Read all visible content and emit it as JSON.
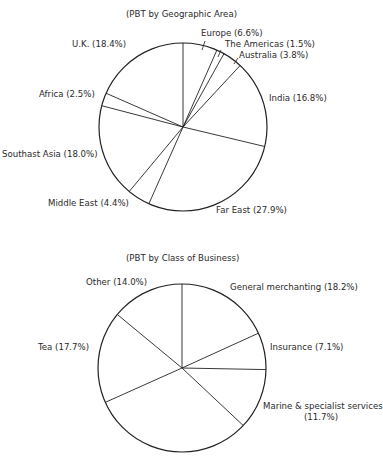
{
  "chart_data": [
    {
      "type": "pie",
      "title": "(PBT by Geographic Area)",
      "start": "top",
      "direction": "clockwise",
      "categories": [
        "Europe",
        "The Americas",
        "Australia",
        "India",
        "Far East",
        "Middle East",
        "Southast Asia",
        "Africa",
        "U.K."
      ],
      "values": [
        6.6,
        1.5,
        3.8,
        16.8,
        27.9,
        4.4,
        18.0,
        2.5,
        18.4
      ],
      "labels": [
        "Europe (6.6%)",
        "The Americas (1.5%)",
        "Australia (3.8%)",
        "India (16.8%)",
        "Far East (27.9%)",
        "Middle East (4.4%)",
        "Southast Asia (18.0%)",
        "Africa (2.5%)",
        "U.K. (18.4%)"
      ]
    },
    {
      "type": "pie",
      "title": "(PBT by Class of Business)",
      "start": "top",
      "direction": "clockwise",
      "categories": [
        "General merchanting",
        "Insurance",
        "Marine & specialist services",
        "(unlabeled)",
        "Tea",
        "Other"
      ],
      "values": [
        18.2,
        7.1,
        11.7,
        31.3,
        17.7,
        14.0
      ],
      "labels": [
        "General merchanting (18.2%)",
        "Insurance (7.1%)",
        "Marine & specialist services (11.7%)",
        "",
        "Tea (17.7%)",
        "Other (14.0%)"
      ]
    }
  ],
  "chart1": {
    "title": "(PBT by Geographic Area)",
    "labels": {
      "europe": "Europe (6.6%)",
      "americas": "The Americas (1.5%)",
      "australia": "Australia (3.8%)",
      "india": "India (16.8%)",
      "far_east": "Far East (27.9%)",
      "middle_east": "Middle East (4.4%)",
      "southeast_asia": "Southast Asia (18.0%)",
      "africa": "Africa (2.5%)",
      "uk": "U.K. (18.4%)"
    }
  },
  "chart2": {
    "title": "(PBT by Class of Business)",
    "labels": {
      "general": "General merchanting (18.2%)",
      "insurance": "Insurance (7.1%)",
      "marine_line1": "Marine & specialist services",
      "marine_line2": "(11.7%)",
      "tea": "Tea (17.7%)",
      "other": "Other (14.0%)"
    }
  }
}
